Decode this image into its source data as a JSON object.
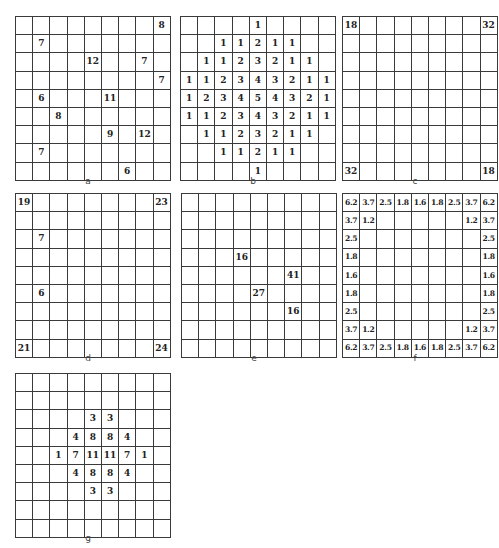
{
  "panels": [
    {
      "id": "a",
      "label": "a",
      "left": 15,
      "top": 16,
      "rows": [
        [
          "",
          "",
          "",
          "",
          "",
          "",
          "",
          "",
          "8"
        ],
        [
          "",
          "7",
          "",
          "",
          "",
          "",
          "",
          "",
          ""
        ],
        [
          "",
          "",
          "",
          "",
          "12",
          "",
          "",
          "7",
          ""
        ],
        [
          "",
          "",
          "",
          "",
          "",
          "",
          "",
          "",
          "7"
        ],
        [
          "",
          "6",
          "",
          "",
          "",
          "11",
          "",
          "",
          ""
        ],
        [
          "",
          "",
          "8",
          "",
          "",
          "",
          "",
          "",
          ""
        ],
        [
          "",
          "",
          "",
          "",
          "",
          "9",
          "",
          "12",
          ""
        ],
        [
          "",
          "7",
          "",
          "",
          "",
          "",
          "",
          "",
          ""
        ],
        [
          "",
          "",
          "",
          "",
          "",
          "",
          "6",
          "",
          ""
        ]
      ]
    },
    {
      "id": "b",
      "label": "b",
      "left": 180,
      "top": 16,
      "rows": [
        [
          "",
          "",
          "",
          "",
          "1",
          "",
          "",
          "",
          ""
        ],
        [
          "",
          "",
          "1",
          "1",
          "2",
          "1",
          "1",
          "",
          ""
        ],
        [
          "",
          "1",
          "1",
          "2",
          "3",
          "2",
          "1",
          "1",
          ""
        ],
        [
          "1",
          "1",
          "2",
          "3",
          "4",
          "3",
          "2",
          "1",
          "1"
        ],
        [
          "1",
          "2",
          "3",
          "4",
          "5",
          "4",
          "3",
          "2",
          "1"
        ],
        [
          "1",
          "1",
          "2",
          "3",
          "4",
          "3",
          "2",
          "1",
          "1"
        ],
        [
          "",
          "1",
          "1",
          "2",
          "3",
          "2",
          "1",
          "1",
          ""
        ],
        [
          "",
          "",
          "1",
          "1",
          "2",
          "1",
          "1",
          "",
          ""
        ],
        [
          "",
          "",
          "",
          "",
          "1",
          "",
          "",
          "",
          ""
        ]
      ]
    },
    {
      "id": "c",
      "label": "c",
      "left": 342,
      "top": 16,
      "rows": [
        [
          "18",
          "",
          "",
          "",
          "",
          "",
          "",
          "",
          "32"
        ],
        [
          "",
          "",
          "",
          "",
          "",
          "",
          "",
          "",
          ""
        ],
        [
          "",
          "",
          "",
          "",
          "",
          "",
          "",
          "",
          ""
        ],
        [
          "",
          "",
          "",
          "",
          "",
          "",
          "",
          "",
          ""
        ],
        [
          "",
          "",
          "",
          "",
          "",
          "",
          "",
          "",
          ""
        ],
        [
          "",
          "",
          "",
          "",
          "",
          "",
          "",
          "",
          ""
        ],
        [
          "",
          "",
          "",
          "",
          "",
          "",
          "",
          "",
          ""
        ],
        [
          "",
          "",
          "",
          "",
          "",
          "",
          "",
          "",
          ""
        ],
        [
          "32",
          "",
          "",
          "",
          "",
          "",
          "",
          "",
          "18"
        ]
      ]
    },
    {
      "id": "d",
      "label": "d",
      "left": 15,
      "top": 193,
      "rows": [
        [
          "19",
          "",
          "",
          "",
          "",
          "",
          "",
          "",
          "23"
        ],
        [
          "",
          "",
          "",
          "",
          "",
          "",
          "",
          "",
          ""
        ],
        [
          "",
          "7",
          "",
          "",
          "",
          "",
          "",
          "",
          ""
        ],
        [
          "",
          "",
          "",
          "",
          "",
          "",
          "",
          "",
          ""
        ],
        [
          "",
          "",
          "",
          "",
          "",
          "",
          "",
          "",
          ""
        ],
        [
          "",
          "6",
          "",
          "",
          "",
          "",
          "",
          "",
          ""
        ],
        [
          "",
          "",
          "",
          "",
          "",
          "",
          "",
          "",
          ""
        ],
        [
          "",
          "",
          "",
          "",
          "",
          "",
          "",
          "",
          ""
        ],
        [
          "21",
          "",
          "",
          "",
          "",
          "",
          "",
          "",
          "24"
        ]
      ]
    },
    {
      "id": "e",
      "label": "e",
      "left": 181,
      "top": 193,
      "rows": [
        [
          "",
          "",
          "",
          "",
          "",
          "",
          "",
          "",
          ""
        ],
        [
          "",
          "",
          "",
          "",
          "",
          "",
          "",
          "",
          ""
        ],
        [
          "",
          "",
          "",
          "",
          "",
          "",
          "",
          "",
          ""
        ],
        [
          "",
          "",
          "",
          "16",
          "",
          "",
          "",
          "",
          ""
        ],
        [
          "",
          "",
          "",
          "",
          "",
          "",
          "41",
          "",
          ""
        ],
        [
          "",
          "",
          "",
          "",
          "27",
          "",
          "",
          "",
          ""
        ],
        [
          "",
          "",
          "",
          "",
          "",
          "",
          "16",
          "",
          ""
        ],
        [
          "",
          "",
          "",
          "",
          "",
          "",
          "",
          "",
          ""
        ],
        [
          "",
          "",
          "",
          "",
          "",
          "",
          "",
          "",
          ""
        ]
      ]
    },
    {
      "id": "f",
      "label": "f",
      "left": 342,
      "top": 193,
      "small": true,
      "rows": [
        [
          "6.2",
          "3.7",
          "2.5",
          "1.8",
          "1.6",
          "1.8",
          "2.5",
          "3.7",
          "6.2"
        ],
        [
          "3.7",
          "1.2",
          "",
          "",
          "",
          "",
          "",
          "1.2",
          "3.7"
        ],
        [
          "2.5",
          "",
          "",
          "",
          "",
          "",
          "",
          "",
          "2.5"
        ],
        [
          "1.8",
          "",
          "",
          "",
          "",
          "",
          "",
          "",
          "1.8"
        ],
        [
          "1.6",
          "",
          "",
          "",
          "",
          "",
          "",
          "",
          "1.6"
        ],
        [
          "1.8",
          "",
          "",
          "",
          "",
          "",
          "",
          "",
          "1.8"
        ],
        [
          "2.5",
          "",
          "",
          "",
          "",
          "",
          "",
          "",
          "2.5"
        ],
        [
          "3.7",
          "1.2",
          "",
          "",
          "",
          "",
          "",
          "1.2",
          "3.7"
        ],
        [
          "6.2",
          "3.7",
          "2.5",
          "1.8",
          "1.6",
          "1.8",
          "2.5",
          "3.7",
          "6.2"
        ]
      ]
    },
    {
      "id": "g",
      "label": "g",
      "left": 15,
      "top": 373,
      "rows": [
        [
          "",
          "",
          "",
          "",
          "",
          "",
          "",
          "",
          ""
        ],
        [
          "",
          "",
          "",
          "",
          "",
          "",
          "",
          "",
          ""
        ],
        [
          "",
          "",
          "",
          "",
          "3",
          "3",
          "",
          "",
          ""
        ],
        [
          "",
          "",
          "",
          "4",
          "8",
          "8",
          "4",
          "",
          ""
        ],
        [
          "",
          "",
          "1",
          "7",
          "11",
          "11",
          "7",
          "1",
          ""
        ],
        [
          "",
          "",
          "",
          "4",
          "8",
          "8",
          "4",
          "",
          ""
        ],
        [
          "",
          "",
          "",
          "",
          "3",
          "3",
          "",
          "",
          ""
        ],
        [
          "",
          "",
          "",
          "",
          "",
          "",
          "",
          "",
          ""
        ],
        [
          "",
          "",
          "",
          "",
          "",
          "",
          "",
          "",
          ""
        ]
      ]
    }
  ]
}
